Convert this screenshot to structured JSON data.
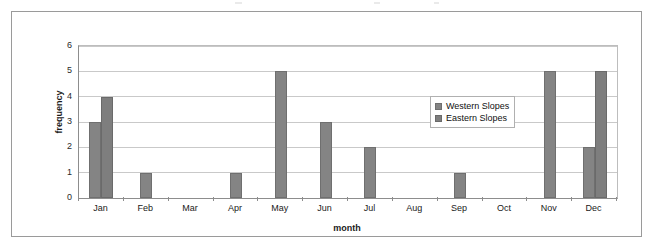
{
  "figure": {
    "outer_border_color": "#9a9a9a",
    "background": "#ffffff"
  },
  "chart_data": {
    "type": "bar",
    "title": "",
    "xlabel": "month",
    "ylabel": "frequency",
    "ylim": [
      0,
      6
    ],
    "yticks": [
      0,
      1,
      2,
      3,
      4,
      5,
      6
    ],
    "grid": true,
    "legend_position": "inside-right",
    "categories": [
      "Jan",
      "Feb",
      "Mar",
      "Apr",
      "May",
      "Jun",
      "Jul",
      "Aug",
      "Sep",
      "Oct",
      "Nov",
      "Dec"
    ],
    "series": [
      {
        "name": "Western Slopes",
        "color": "#848484",
        "values": [
          3,
          1,
          0,
          1,
          5,
          3,
          2,
          0,
          1,
          0,
          5,
          2
        ]
      },
      {
        "name": "Eastern Slopes",
        "color": "#7e7e7e",
        "values": [
          4,
          0,
          0,
          0,
          0,
          0,
          0,
          0,
          0,
          0,
          0,
          5
        ]
      }
    ]
  }
}
